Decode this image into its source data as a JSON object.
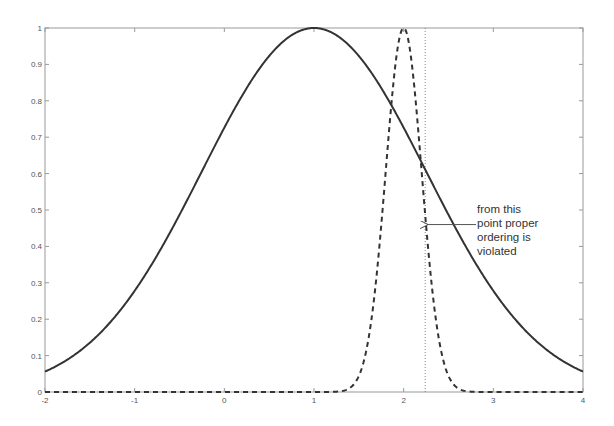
{
  "chart_data": {
    "type": "line",
    "title": "",
    "xlabel": "",
    "ylabel": "",
    "xlim": [
      -2,
      4
    ],
    "ylim": [
      0,
      1
    ],
    "grid": false,
    "legend": null,
    "x_ticks": [
      -2,
      -1,
      0,
      1,
      2,
      3,
      4
    ],
    "x_tick_labels": [
      "-2",
      "-1",
      "0",
      "1",
      "2",
      "3",
      "4"
    ],
    "y_ticks": [
      0,
      0.1,
      0.2,
      0.3,
      0.4,
      0.5,
      0.6,
      0.7,
      0.8,
      0.9,
      1
    ],
    "y_tick_labels": [
      "0",
      "0.1",
      "0.2",
      "0.3",
      "0.4",
      "0.5",
      "0.6",
      "0.7",
      "0.8",
      "0.9",
      "1"
    ],
    "series": [
      {
        "name": "wide-gaussian",
        "style": "solid",
        "color": "#333333",
        "function": "exp(-(x-1)^2/(2*1.25^2))",
        "mean": 1,
        "sigma": 1.25,
        "x": [
          -2,
          -1.5,
          -1,
          -0.5,
          0,
          0.5,
          1,
          1.5,
          2,
          2.24,
          2.5,
          3,
          3.5,
          4
        ],
        "values": [
          0.056,
          0.135,
          0.278,
          0.487,
          0.726,
          0.923,
          1.0,
          0.923,
          0.726,
          0.611,
          0.487,
          0.278,
          0.135,
          0.056
        ]
      },
      {
        "name": "narrow-gaussian",
        "style": "dashed",
        "color": "#333333",
        "function": "exp(-(x-2)^2/(2*0.2^2))",
        "mean": 2,
        "sigma": 0.2,
        "x": [
          -2,
          1.2,
          1.4,
          1.6,
          1.8,
          2.0,
          2.2,
          2.4,
          2.6,
          2.8,
          4
        ],
        "values": [
          0,
          0.0003,
          0.011,
          0.135,
          0.607,
          1.0,
          0.607,
          0.135,
          0.011,
          0.0003,
          0
        ]
      }
    ],
    "reference_lines": [
      {
        "orientation": "vertical",
        "x": 2.24,
        "style": "dotted"
      }
    ],
    "annotations": [
      {
        "text": "from this point proper ordering is violated",
        "lines": [
          "from this",
          "point proper",
          "ordering is",
          "violated"
        ],
        "arrow_to": {
          "x": 2.24,
          "y": 0.46
        }
      }
    ]
  },
  "annotation": {
    "line1": "from this",
    "line2": "point proper",
    "line3": "ordering is",
    "line4": "violated"
  }
}
